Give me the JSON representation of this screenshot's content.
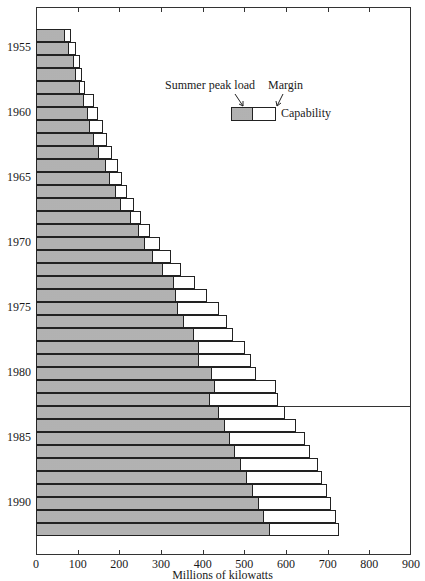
{
  "chart_data": {
    "type": "bar",
    "orientation": "horizontal",
    "stacked": true,
    "title": "",
    "xlabel": "Millions of kilowatts",
    "ylabel": "",
    "xlim": [
      0,
      900
    ],
    "x_ticks": [
      "0",
      "100",
      "200",
      "300",
      "400",
      "500",
      "600",
      "700",
      "800",
      "900"
    ],
    "y_tick_labels": [
      "1955",
      "1960",
      "1965",
      "1970",
      "1975",
      "1980",
      "1985",
      "1990"
    ],
    "grid": false,
    "legend": {
      "position": "upper center",
      "entries": [
        "Summer peak load",
        "Margin",
        "Capability"
      ]
    },
    "annotations": [
      "Horizontal line between 1982 and 1983 separating historical data from projections"
    ],
    "categories": [
      "1954",
      "1955",
      "1956",
      "1957",
      "1958",
      "1959",
      "1960",
      "1961",
      "1962",
      "1963",
      "1964",
      "1965",
      "1966",
      "1967",
      "1968",
      "1969",
      "1970",
      "1971",
      "1972",
      "1973",
      "1974",
      "1975",
      "1976",
      "1977",
      "1978",
      "1979",
      "1980",
      "1981",
      "1982",
      "1983",
      "1984",
      "1985",
      "1986",
      "1987",
      "1988",
      "1989",
      "1990",
      "1991",
      "1992"
    ],
    "series": [
      {
        "name": "Summer peak load",
        "values": [
          70,
          80,
          90,
          97,
          105,
          115,
          125,
          130,
          140,
          150,
          167,
          177,
          193,
          205,
          227,
          247,
          262,
          281,
          305,
          330,
          337,
          340,
          355,
          379,
          392,
          390,
          422,
          430,
          418,
          438,
          454,
          466,
          478,
          492,
          506,
          520,
          534,
          548,
          562
        ]
      },
      {
        "name": "Capability",
        "values": [
          85,
          95,
          105,
          110,
          118,
          140,
          150,
          160,
          170,
          183,
          197,
          207,
          218,
          235,
          253,
          274,
          297,
          325,
          349,
          381,
          410,
          440,
          458,
          472,
          502,
          516,
          529,
          576,
          580,
          598,
          624,
          645,
          657,
          677,
          687,
          699,
          709,
          720,
          727
        ]
      }
    ]
  },
  "legend": {
    "peak_label": "Summer peak load",
    "margin_label": "Margin",
    "capability_label": "Capability"
  },
  "axis": {
    "x_title": "Millions of kilowatts"
  }
}
